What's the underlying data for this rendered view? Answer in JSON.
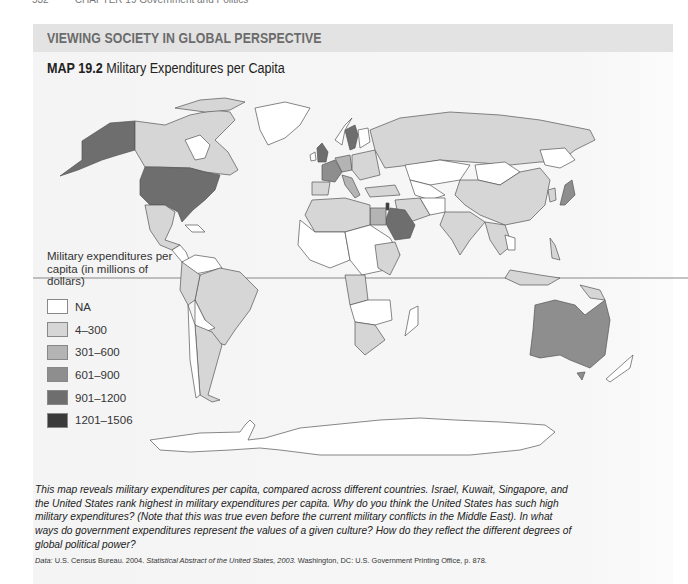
{
  "running_head": {
    "page": "532",
    "chapter": "CHAPTER 19 Government and Politics"
  },
  "panel": {
    "band_label": "VIEWING SOCIETY IN GLOBAL PERSPECTIVE",
    "map_number": "MAP 19.2",
    "map_title": "Military Expenditures per Capita"
  },
  "legend": {
    "title": "Military expenditures per capita (in millions of dollars)",
    "items": [
      {
        "label": "NA",
        "color": "#ffffff"
      },
      {
        "label": "4–300",
        "color": "#d6d6d6"
      },
      {
        "label": "301–600",
        "color": "#b4b4b4"
      },
      {
        "label": "601–900",
        "color": "#8e8e8e"
      },
      {
        "label": "901–1200",
        "color": "#6e6e6e"
      },
      {
        "label": "1201–1506",
        "color": "#3a3a3a"
      }
    ]
  },
  "map_regions": {
    "united_states": "901–1200",
    "alaska": "901–1200",
    "canada": "4–300",
    "mexico": "4–300",
    "greenland": "NA",
    "south_america_brazil": "4–300",
    "argentina": "4–300",
    "bolivia": "NA",
    "united_kingdom": "901–1200",
    "france": "601–900",
    "sweden": "901–1200",
    "russia": "4–300",
    "china": "4–300",
    "mongolia": "NA",
    "kazakhstan": "NA",
    "india": "4–300",
    "japan": "601–900",
    "saudi_arabia": "901–1200",
    "israel": "1201–1506",
    "egypt": "301–600",
    "australia": "601–900",
    "south_africa": "4–300",
    "antarctica": "NA"
  },
  "caption": "This map reveals military expenditures per capita, compared across different countries. Israel, Kuwait, Singapore, and the United States rank highest in military expenditures per capita. Why do you think the United States has such high military expenditures? (Note that this was true even before the current military conflicts in the Middle East). In what ways do government expenditures represent the values of a given culture? How do they reflect the different degrees of global political power?",
  "source": {
    "prefix": "Data:",
    "author": "U.S. Census Bureau. 2004.",
    "title": "Statistical Abstract of the United States, 2003.",
    "rest": "Washington, DC: U.S. Government Printing Office, p. 878."
  }
}
